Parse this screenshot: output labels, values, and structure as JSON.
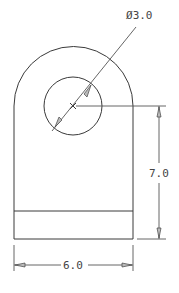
{
  "drawing": {
    "type": "mechanical-part-front-view",
    "colors": {
      "line": "#3a3a3a",
      "dimension": "#555555",
      "background": "#ffffff"
    },
    "dimensions": {
      "hole_diameter": {
        "symbol": "Ø",
        "value": "3.0"
      },
      "height": {
        "value": "7.0"
      },
      "width": {
        "value": "6.0"
      }
    }
  }
}
